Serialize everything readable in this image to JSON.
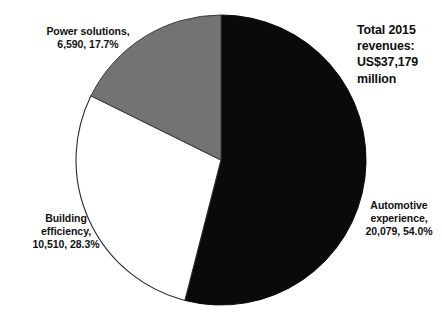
{
  "chart_data": {
    "type": "pie",
    "title": "Total 2015 revenues: US$37,179 million",
    "title_lines": [
      "Total 2015",
      "revenues:",
      "US$37,179",
      "million"
    ],
    "units": "US$ million",
    "total": 37179,
    "categories": [
      "Automotive experience",
      "Building efficiency",
      "Power solutions"
    ],
    "values": [
      20079,
      10510,
      6590
    ],
    "percentages": [
      54.0,
      28.3,
      17.7
    ],
    "value_labels": [
      "20,079",
      "10,510",
      "6,590"
    ],
    "percent_labels": [
      "54.0%",
      "28.3%",
      "17.7%"
    ],
    "colors": [
      "#0a0a0a",
      "#ffffff",
      "#737373"
    ],
    "legend": "none",
    "grid": false,
    "start_angle_deg": 0,
    "direction": "clockwise",
    "slices": [
      {
        "name": "Automotive experience",
        "value": 20079,
        "percent": 54.0,
        "color": "#0a0a0a",
        "label_lines": [
          "Automotive",
          "experience,",
          "20,079, 54.0%"
        ]
      },
      {
        "name": "Building efficiency",
        "value": 10510,
        "percent": 28.3,
        "color": "#ffffff",
        "label_lines": [
          "Building",
          "efficiency,",
          "10,510, 28.3%"
        ]
      },
      {
        "name": "Power solutions",
        "value": 6590,
        "percent": 17.7,
        "color": "#737373",
        "label_lines": [
          "Power solutions,",
          "6,590, 17.7%"
        ]
      }
    ]
  },
  "labels": {
    "power": {
      "line1": "Power solutions,",
      "line2": "6,590, 17.7%"
    },
    "building": {
      "line1": "Building",
      "line2": "efficiency,",
      "line3": "10,510, 28.3%"
    },
    "automotive": {
      "line1": "Automotive",
      "line2": "experience,",
      "line3": "20,079, 54.0%"
    }
  },
  "title": {
    "line1": "Total 2015",
    "line2": "revenues:",
    "line3": "US$37,179",
    "line4": "million"
  },
  "geometry": {
    "center_x": 221,
    "center_y": 160,
    "radius": 145
  },
  "style": {
    "background": "#ffffff",
    "outline": "#2b2b2b",
    "text": "#111111"
  }
}
